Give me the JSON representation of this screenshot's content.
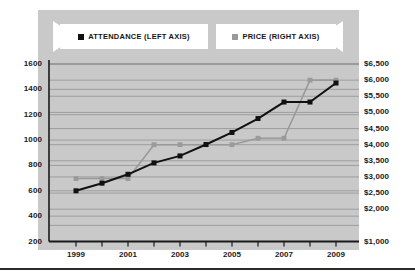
{
  "chart_data": {
    "type": "line",
    "title": "",
    "xlabel": "",
    "ylabel": "",
    "grid": true,
    "legend_position": "top",
    "x": [
      1999,
      2000,
      2001,
      2002,
      2003,
      2004,
      2005,
      2006,
      2007,
      2008,
      2009
    ],
    "x_tick_labels": [
      "1999",
      "2001",
      "2003",
      "2005",
      "2007",
      "2009"
    ],
    "x_tick_values": [
      1999,
      2001,
      2003,
      2005,
      2007,
      2009
    ],
    "left_axis": {
      "label": "ATTENDANCE (LEFT AXIS)",
      "ylim": [
        200,
        1600
      ],
      "ticks": [
        200,
        400,
        600,
        800,
        1000,
        1200,
        1400,
        1600
      ],
      "tick_labels": [
        "200",
        "400",
        "600",
        "800",
        "1000",
        "1200",
        "1400",
        "1600"
      ]
    },
    "right_axis": {
      "label": "PRICE (RIGHT AXIS)",
      "ylim": [
        1000,
        6500
      ],
      "ticks": [
        1000,
        1500,
        2000,
        2500,
        3000,
        3500,
        4000,
        4500,
        5000,
        5500,
        6000,
        6500
      ],
      "tick_labels": [
        "$1,000",
        "",
        "$2,000",
        "$2,500",
        "$3,000",
        "$3,500",
        "$4,000",
        "$4,500",
        "$5,000",
        "$5,500",
        "$6,000",
        "$6,500"
      ]
    },
    "series": [
      {
        "name": "ATTENDANCE (LEFT AXIS)",
        "axis": "left",
        "color": "#111111",
        "marker": "square",
        "values": [
          600,
          660,
          730,
          820,
          875,
          965,
          1060,
          1170,
          1300,
          1300,
          1450
        ]
      },
      {
        "name": "PRICE (RIGHT AXIS)",
        "axis": "right",
        "color": "#9a9a9a",
        "marker": "square",
        "values": [
          2950,
          2950,
          2950,
          4000,
          4000,
          4000,
          4000,
          4200,
          4200,
          6000,
          6000
        ]
      }
    ]
  },
  "legend": {
    "entries": [
      {
        "label": "ATTENDANCE (LEFT AXIS)",
        "color": "#111111"
      },
      {
        "label": "PRICE (RIGHT AXIS)",
        "color": "#9a9a9a"
      }
    ]
  },
  "colors": {
    "panel_background": "#c9c9c9",
    "page_background": "#ffffff",
    "attendance": "#111111",
    "price": "#9a9a9a",
    "gridline": "#8b8b8b",
    "axis": "#1a1a1a",
    "text": "#1a1a1a"
  }
}
